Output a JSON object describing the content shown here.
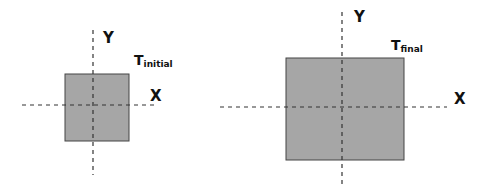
{
  "panels": [
    {
      "name": "initial",
      "rect": {
        "x": 65,
        "y": 74,
        "w": 64,
        "h": 67
      },
      "vaxis": {
        "x": 93,
        "y1": 30,
        "y2": 175
      },
      "haxis": {
        "y": 105,
        "x1": 22,
        "x2": 156
      },
      "y_label": "Y",
      "x_label": "X",
      "t_main": "T",
      "t_sub": "initial"
    },
    {
      "name": "final",
      "rect": {
        "x": 286,
        "y": 58,
        "w": 118,
        "h": 102
      },
      "vaxis": {
        "x": 342,
        "y1": 12,
        "y2": 186
      },
      "haxis": {
        "y": 107,
        "x1": 220,
        "x2": 447
      },
      "y_label": "Y",
      "x_label": "X",
      "t_main": "T",
      "t_sub": "final"
    }
  ],
  "colors": {
    "fill": "#a6a6a6",
    "stroke": "#444444",
    "axis": "#333333"
  }
}
